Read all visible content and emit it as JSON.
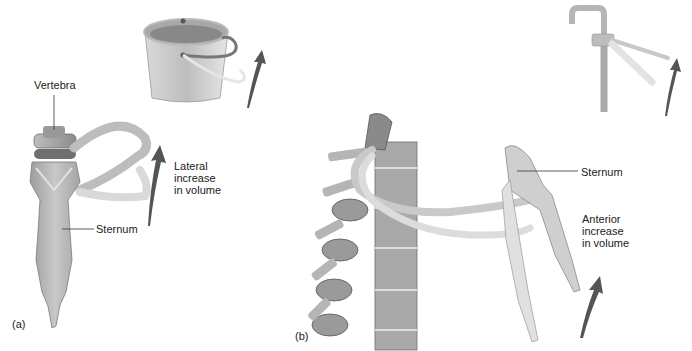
{
  "figure": {
    "panel_a": {
      "letter": "(a)",
      "labels": {
        "vertebra": "Vertebra",
        "sternum": "Sternum",
        "motion": [
          "Lateral",
          "increase",
          "in volume"
        ]
      },
      "analogy_icon": "bucket-handle-icon"
    },
    "panel_b": {
      "letter": "(b)",
      "labels": {
        "sternum": "Sternum",
        "motion": [
          "Anterior",
          "increase",
          "in volume"
        ]
      },
      "analogy_icon": "pump-handle-icon"
    },
    "colors": {
      "bone": "#c9c9c9",
      "bone_dark": "#8a8a8a",
      "bone_light": "#e4e4e4",
      "arrow": "#555555",
      "leader_line": "#333333",
      "metal": "#b8b8b8",
      "background": "#ffffff"
    }
  }
}
